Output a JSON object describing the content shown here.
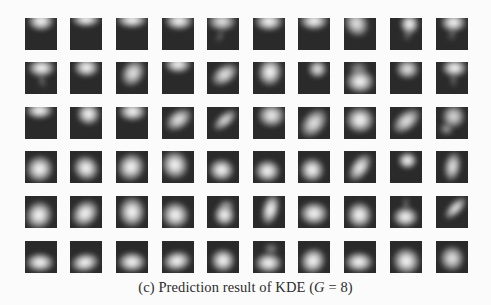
{
  "figure": {
    "caption": {
      "label": "(c)",
      "text": "Prediction result of KDE (",
      "var": "G",
      "rest": " = 8)"
    },
    "grid": {
      "rows": 6,
      "cols": 10,
      "col_x": [
        25,
        70,
        116,
        162,
        207,
        253,
        298,
        344,
        390,
        436
      ],
      "row_y": [
        18,
        62,
        107,
        151,
        196,
        241
      ],
      "tile_size": 32
    },
    "tiles": [
      [
        {
          "cx": 50,
          "cy": 10,
          "rx": 42,
          "ry": 32,
          "rot": 0,
          "b": 1
        },
        {
          "cx": 50,
          "cy": 5,
          "rx": 44,
          "ry": 24,
          "rot": 0,
          "b": 1
        },
        {
          "cx": 50,
          "cy": 6,
          "rx": 46,
          "ry": 26,
          "rot": 0,
          "b": 1
        },
        {
          "cx": 52,
          "cy": 8,
          "rx": 44,
          "ry": 28,
          "rot": 0,
          "b": 1
        },
        {
          "cx": 48,
          "cy": 10,
          "rx": 44,
          "ry": 30,
          "rot": 0,
          "b": 0.9,
          "tail": {
            "cx": 40,
            "cy": 55,
            "rx": 10,
            "ry": 22,
            "rot": 25,
            "b": 0.35
          }
        },
        {
          "cx": 50,
          "cy": 12,
          "rx": 44,
          "ry": 30,
          "rot": 0,
          "b": 1
        },
        {
          "cx": 50,
          "cy": 8,
          "rx": 44,
          "ry": 28,
          "rot": 0,
          "b": 1
        },
        {
          "cx": 40,
          "cy": 18,
          "rx": 36,
          "ry": 42,
          "rot": -30,
          "b": 0.9
        },
        {
          "cx": 62,
          "cy": 18,
          "rx": 30,
          "ry": 32,
          "rot": 0,
          "b": 1,
          "tail": {
            "cx": 55,
            "cy": 50,
            "rx": 12,
            "ry": 22,
            "rot": 20,
            "b": 0.35
          }
        },
        {
          "cx": 55,
          "cy": 14,
          "rx": 40,
          "ry": 30,
          "rot": 0,
          "b": 1,
          "tail": {
            "cx": 48,
            "cy": 50,
            "rx": 12,
            "ry": 22,
            "rot": 10,
            "b": 0.3
          }
        }
      ],
      [
        {
          "cx": 52,
          "cy": 18,
          "rx": 42,
          "ry": 28,
          "rot": 0,
          "b": 1,
          "tail": {
            "cx": 55,
            "cy": 58,
            "rx": 10,
            "ry": 24,
            "rot": -15,
            "b": 0.4
          }
        },
        {
          "cx": 52,
          "cy": 16,
          "rx": 40,
          "ry": 30,
          "rot": 0,
          "b": 1
        },
        {
          "cx": 52,
          "cy": 36,
          "rx": 34,
          "ry": 44,
          "rot": 30,
          "b": 0.9
        },
        {
          "cx": 50,
          "cy": 8,
          "rx": 42,
          "ry": 26,
          "rot": 0,
          "b": 1
        },
        {
          "cx": 56,
          "cy": 40,
          "rx": 30,
          "ry": 46,
          "rot": 55,
          "b": 0.9
        },
        {
          "cx": 55,
          "cy": 32,
          "rx": 38,
          "ry": 44,
          "rot": 10,
          "b": 1
        },
        {
          "cx": 62,
          "cy": 22,
          "rx": 30,
          "ry": 28,
          "rot": 0,
          "b": 0.9
        },
        {
          "cx": 50,
          "cy": 62,
          "rx": 44,
          "ry": 36,
          "rot": 0,
          "b": 1,
          "tail": {
            "cx": 46,
            "cy": 22,
            "rx": 30,
            "ry": 26,
            "rot": 0,
            "b": 0.5
          }
        },
        {
          "cx": 55,
          "cy": 22,
          "rx": 36,
          "ry": 30,
          "rot": 0,
          "b": 0.9
        },
        {
          "cx": 58,
          "cy": 18,
          "rx": 40,
          "ry": 28,
          "rot": 0,
          "b": 1,
          "tail": {
            "cx": 55,
            "cy": 55,
            "rx": 12,
            "ry": 22,
            "rot": 0,
            "b": 0.35
          }
        }
      ],
      [
        {
          "cx": 45,
          "cy": 10,
          "rx": 42,
          "ry": 26,
          "rot": 0,
          "b": 1
        },
        {
          "cx": 58,
          "cy": 20,
          "rx": 36,
          "ry": 34,
          "rot": 10,
          "b": 1
        },
        {
          "cx": 52,
          "cy": 14,
          "rx": 42,
          "ry": 30,
          "rot": 0,
          "b": 1
        },
        {
          "cx": 52,
          "cy": 40,
          "rx": 30,
          "ry": 46,
          "rot": 55,
          "b": 0.9
        },
        {
          "cx": 55,
          "cy": 40,
          "rx": 22,
          "ry": 44,
          "rot": 50,
          "b": 0.85
        },
        {
          "cx": 58,
          "cy": 28,
          "rx": 42,
          "ry": 36,
          "rot": 0,
          "b": 0.95
        },
        {
          "cx": 50,
          "cy": 50,
          "rx": 34,
          "ry": 50,
          "rot": 40,
          "b": 0.9
        },
        {
          "cx": 50,
          "cy": 40,
          "rx": 44,
          "ry": 40,
          "rot": 0,
          "b": 1
        },
        {
          "cx": 52,
          "cy": 45,
          "rx": 30,
          "ry": 50,
          "rot": 50,
          "b": 0.9
        },
        {
          "cx": 55,
          "cy": 30,
          "rx": 36,
          "ry": 36,
          "rot": 0,
          "b": 0.85,
          "tail": {
            "cx": 32,
            "cy": 68,
            "rx": 20,
            "ry": 18,
            "rot": 0,
            "b": 0.6
          }
        }
      ],
      [
        {
          "cx": 45,
          "cy": 55,
          "rx": 42,
          "ry": 40,
          "rot": -30,
          "b": 1
        },
        {
          "cx": 48,
          "cy": 55,
          "rx": 40,
          "ry": 38,
          "rot": 40,
          "b": 1
        },
        {
          "cx": 46,
          "cy": 50,
          "rx": 40,
          "ry": 44,
          "rot": 35,
          "b": 1
        },
        {
          "cx": 40,
          "cy": 45,
          "rx": 40,
          "ry": 44,
          "rot": -20,
          "b": 1
        },
        {
          "cx": 45,
          "cy": 60,
          "rx": 38,
          "ry": 34,
          "rot": 0,
          "b": 1
        },
        {
          "cx": 45,
          "cy": 62,
          "rx": 40,
          "ry": 34,
          "rot": 0,
          "b": 1
        },
        {
          "cx": 45,
          "cy": 60,
          "rx": 38,
          "ry": 38,
          "rot": 20,
          "b": 1
        },
        {
          "cx": 50,
          "cy": 50,
          "rx": 28,
          "ry": 48,
          "rot": 35,
          "b": 0.95
        },
        {
          "cx": 55,
          "cy": 30,
          "rx": 30,
          "ry": 26,
          "rot": 0,
          "b": 1
        },
        {
          "cx": 52,
          "cy": 50,
          "rx": 26,
          "ry": 46,
          "rot": 10,
          "b": 0.9
        }
      ],
      [
        {
          "cx": 42,
          "cy": 60,
          "rx": 40,
          "ry": 44,
          "rot": 30,
          "b": 1
        },
        {
          "cx": 48,
          "cy": 56,
          "rx": 38,
          "ry": 46,
          "rot": 45,
          "b": 1
        },
        {
          "cx": 50,
          "cy": 50,
          "rx": 40,
          "ry": 48,
          "rot": 0,
          "b": 1
        },
        {
          "cx": 42,
          "cy": 60,
          "rx": 42,
          "ry": 40,
          "rot": 20,
          "b": 1
        },
        {
          "cx": 55,
          "cy": 60,
          "rx": 34,
          "ry": 34,
          "rot": 0,
          "b": 1,
          "tail": {
            "cx": 60,
            "cy": 30,
            "rx": 24,
            "ry": 16,
            "rot": 0,
            "b": 0.6
          }
        },
        {
          "cx": 55,
          "cy": 42,
          "rx": 26,
          "ry": 48,
          "rot": 15,
          "b": 1
        },
        {
          "cx": 50,
          "cy": 55,
          "rx": 44,
          "ry": 36,
          "rot": 0,
          "b": 1
        },
        {
          "cx": 48,
          "cy": 60,
          "rx": 38,
          "ry": 40,
          "rot": 0,
          "b": 1
        },
        {
          "cx": 48,
          "cy": 65,
          "rx": 38,
          "ry": 32,
          "rot": 0,
          "b": 1,
          "tail": {
            "cx": 50,
            "cy": 25,
            "rx": 10,
            "ry": 22,
            "rot": 0,
            "b": 0.4
          }
        },
        {
          "cx": 62,
          "cy": 38,
          "rx": 20,
          "ry": 44,
          "rot": 45,
          "b": 0.9
        }
      ],
      [
        {
          "cx": 48,
          "cy": 68,
          "rx": 44,
          "ry": 30,
          "rot": 0,
          "b": 1
        },
        {
          "cx": 48,
          "cy": 66,
          "rx": 44,
          "ry": 30,
          "rot": -10,
          "b": 1
        },
        {
          "cx": 50,
          "cy": 65,
          "rx": 44,
          "ry": 32,
          "rot": 0,
          "b": 1
        },
        {
          "cx": 48,
          "cy": 62,
          "rx": 44,
          "ry": 32,
          "rot": -10,
          "b": 1
        },
        {
          "cx": 50,
          "cy": 60,
          "rx": 36,
          "ry": 36,
          "rot": 0,
          "b": 1
        },
        {
          "cx": 48,
          "cy": 68,
          "rx": 42,
          "ry": 32,
          "rot": 0,
          "b": 1,
          "tail": {
            "cx": 55,
            "cy": 25,
            "rx": 22,
            "ry": 18,
            "rot": 0,
            "b": 0.45
          }
        },
        {
          "cx": 48,
          "cy": 62,
          "rx": 38,
          "ry": 40,
          "rot": 40,
          "b": 1
        },
        {
          "cx": 48,
          "cy": 66,
          "rx": 44,
          "ry": 32,
          "rot": 0,
          "b": 1
        },
        {
          "cx": 50,
          "cy": 62,
          "rx": 42,
          "ry": 40,
          "rot": 30,
          "b": 1
        },
        {
          "cx": 50,
          "cy": 55,
          "rx": 36,
          "ry": 40,
          "rot": 0,
          "b": 0.9
        }
      ]
    ],
    "colors": {
      "page_bg": "#fbfbfb",
      "tile_bg": "#2a2a2a",
      "blob": "#ffffff",
      "caption_text": "#2c2c2c"
    }
  }
}
